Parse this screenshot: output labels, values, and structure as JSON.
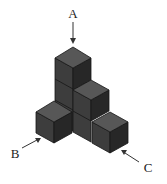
{
  "figure": {
    "cube_count_visible": 6,
    "colors": {
      "top_face": "#575757",
      "left_face": "#3d3d3d",
      "right_face": "#272727",
      "background": "#ffffff"
    },
    "labels": [
      {
        "id": "A",
        "text": "A",
        "direction": "from top"
      },
      {
        "id": "B",
        "text": "B",
        "direction": "from front-left"
      },
      {
        "id": "C",
        "text": "C",
        "direction": "from front-right"
      }
    ]
  }
}
